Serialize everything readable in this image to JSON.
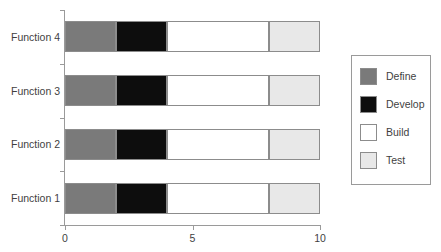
{
  "chart_data": {
    "type": "bar",
    "orientation": "horizontal",
    "stacked": true,
    "title": "",
    "xlabel": "",
    "ylabel": "",
    "categories": [
      "Function 1",
      "Function 2",
      "Function 3",
      "Function 4"
    ],
    "series": [
      {
        "name": "Define",
        "color": "#7a7a7a",
        "values": [
          2,
          2,
          2,
          2
        ]
      },
      {
        "name": "Develop",
        "color": "#0d0d0d",
        "values": [
          2,
          2,
          2,
          2
        ]
      },
      {
        "name": "Build",
        "color": "#ffffff",
        "values": [
          4,
          4,
          4,
          4
        ]
      },
      {
        "name": "Test",
        "color": "#e8e8e8",
        "values": [
          2,
          2,
          2,
          2
        ]
      }
    ],
    "xlim": [
      0,
      10
    ],
    "xticks": [
      0,
      5,
      10
    ],
    "xtick_labels": [
      "0",
      "5",
      "10"
    ],
    "grid": false,
    "legend_position": "right"
  },
  "axis": {
    "category_labels": [
      "Function 4",
      "Function 3",
      "Function 2",
      "Function 1"
    ],
    "x_tick_labels": [
      "0",
      "5",
      "10"
    ]
  },
  "legend": {
    "items": [
      {
        "label": "Define",
        "color": "#7a7a7a"
      },
      {
        "label": "Develop",
        "color": "#0d0d0d"
      },
      {
        "label": "Build",
        "color": "#ffffff"
      },
      {
        "label": "Test",
        "color": "#e8e8e8"
      }
    ]
  },
  "style": {
    "axis_color": "#9a9a9a",
    "segment_border": "#8c8c8c",
    "text_color": "#3f3f3f",
    "background": "#ffffff"
  }
}
